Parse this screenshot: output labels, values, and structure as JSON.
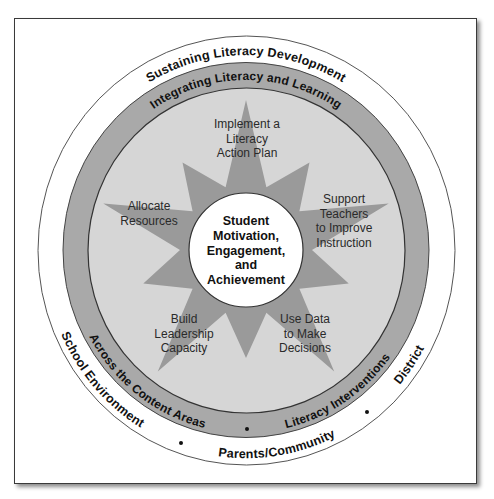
{
  "diagram": {
    "outer_ring": {
      "top": "Sustaining Literacy Development",
      "bottom_left": "School Environment",
      "bottom": "Parents/Community",
      "bottom_right": "District"
    },
    "middle_ring": {
      "top": "Integrating Literacy and Learning",
      "bottom_left": "Across the Content Areas",
      "bottom_right": "Literacy Interventions"
    },
    "star_points": {
      "top": [
        "Implement a",
        "Literacy",
        "Action Plan"
      ],
      "left": [
        "Allocate",
        "Resources"
      ],
      "right": [
        "Support",
        "Teachers",
        "to Improve",
        "Instruction"
      ],
      "bottom_left": [
        "Build",
        "Leadership",
        "Capacity"
      ],
      "bottom_right": [
        "Use Data",
        "to Make",
        "Decisions"
      ]
    },
    "center": [
      "Student",
      "Motivation,",
      "Engagement,",
      "and",
      "Achievement"
    ],
    "colors": {
      "outer_ring": "#ffffff",
      "middle_ring": "#a9a9a9",
      "inner_area": "#d6d6d6",
      "star": "#9a9a9a",
      "center_circle": "#ffffff",
      "line": "#4a4a4a"
    }
  }
}
